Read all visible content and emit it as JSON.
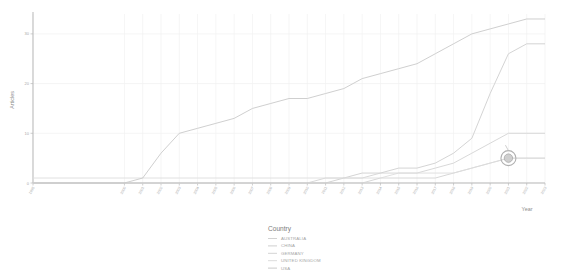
{
  "chart_data": {
    "type": "line",
    "title": "",
    "xlabel": "Year",
    "ylabel": "Articles",
    "xlim": [
      1995,
      2023
    ],
    "ylim": [
      0,
      34
    ],
    "grid": true,
    "legend_position": "bottom",
    "legend_title": "Country",
    "yticks": [
      0,
      10,
      20,
      30
    ],
    "ytick_labels": [
      "0",
      "10",
      "20",
      "30"
    ],
    "x": [
      1995,
      2000,
      2001,
      2002,
      2003,
      2004,
      2005,
      2006,
      2007,
      2008,
      2009,
      2010,
      2011,
      2012,
      2013,
      2014,
      2015,
      2016,
      2017,
      2018,
      2019,
      2020,
      2021,
      2022,
      2023
    ],
    "xtick_years": [
      1995,
      2000,
      2001,
      2002,
      2003,
      2004,
      2005,
      2006,
      2007,
      2008,
      2009,
      2010,
      2011,
      2012,
      2013,
      2014,
      2015,
      2016,
      2017,
      2018,
      2019,
      2020,
      2021,
      2022,
      2023
    ],
    "series": [
      {
        "name": "AUSTRALIA",
        "color": "#d2d2d2",
        "values": [
          0,
          0,
          0,
          0,
          0,
          0,
          0,
          0,
          0,
          0,
          0,
          0,
          0,
          0,
          0,
          1,
          1,
          1,
          1,
          2,
          3,
          4,
          5,
          5,
          5
        ]
      },
      {
        "name": "CHINA",
        "color": "#cfcfcf",
        "values": [
          0,
          0,
          0,
          0,
          0,
          0,
          0,
          0,
          0,
          0,
          0,
          0,
          0,
          1,
          2,
          2,
          3,
          3,
          4,
          6,
          9,
          18,
          26,
          28,
          28
        ]
      },
      {
        "name": "GERMANY",
        "color": "#d4d4d4",
        "values": [
          0,
          0,
          0,
          0,
          0,
          0,
          0,
          0,
          0,
          0,
          0,
          0,
          1,
          1,
          1,
          2,
          2,
          2,
          3,
          4,
          6,
          8,
          10,
          10,
          10
        ]
      },
      {
        "name": "UNITED KINGDOM",
        "color": "#dcdcdc",
        "values": [
          1,
          1,
          1,
          1,
          1,
          1,
          1,
          1,
          1,
          1,
          1,
          1,
          1,
          1,
          1,
          1,
          2,
          2,
          2,
          2,
          3,
          4,
          5,
          5,
          5
        ]
      },
      {
        "name": "USA",
        "color": "#cacaca",
        "values": [
          0,
          0,
          1,
          6,
          10,
          11,
          12,
          13,
          15,
          16,
          17,
          17,
          18,
          19,
          21,
          22,
          23,
          24,
          26,
          28,
          30,
          31,
          32,
          33,
          33
        ]
      }
    ],
    "highlight_marker": {
      "label": "",
      "x": 2021,
      "y": 5
    }
  },
  "legend": {
    "title": "Country",
    "items": [
      {
        "label": "AUSTRALIA"
      },
      {
        "label": "CHINA"
      },
      {
        "label": "GERMANY"
      },
      {
        "label": "UNITED KINGDOM"
      },
      {
        "label": "USA"
      }
    ]
  },
  "axes": {
    "x_title": "Year",
    "y_title": "Articles"
  }
}
